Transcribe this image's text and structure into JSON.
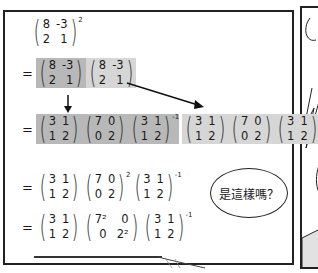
{
  "page": {
    "type": "manga-panel",
    "background": "#ffffff",
    "frame_color": "#222222"
  },
  "highlight_colors": {
    "dark": "#b8b8b8",
    "light": "#d6d6d6"
  },
  "line1": {
    "matrix": [
      [
        "8",
        "-3"
      ],
      [
        "2",
        "1"
      ]
    ],
    "exponent": "2"
  },
  "line2": {
    "equals": "=",
    "matrices": [
      {
        "values": [
          [
            "8",
            "-3"
          ],
          [
            "2",
            "1"
          ]
        ],
        "highlight": "dark"
      },
      {
        "values": [
          [
            "8",
            "-3"
          ],
          [
            "2",
            "1"
          ]
        ],
        "highlight": "light"
      }
    ]
  },
  "line3": {
    "equals": "=",
    "group1": {
      "highlight": "dark",
      "P": [
        [
          "3",
          "1"
        ],
        [
          "1",
          "2"
        ]
      ],
      "D": [
        [
          "7",
          "0"
        ],
        [
          "0",
          "2"
        ]
      ],
      "Pinv": [
        [
          "3",
          "1"
        ],
        [
          "1",
          "2"
        ]
      ],
      "inv_exp": "-1"
    },
    "group2": {
      "highlight": "light",
      "P": [
        [
          "3",
          "1"
        ],
        [
          "1",
          "2"
        ]
      ],
      "D": [
        [
          "7",
          "0"
        ],
        [
          "0",
          "2"
        ]
      ],
      "Pinv": [
        [
          "3",
          "1"
        ],
        [
          "1",
          "2"
        ]
      ],
      "inv_exp": "-1"
    }
  },
  "line4": {
    "equals": "=",
    "P": [
      [
        "3",
        "1"
      ],
      [
        "1",
        "2"
      ]
    ],
    "D": [
      [
        "7",
        "0"
      ],
      [
        "0",
        "2"
      ]
    ],
    "D_exp": "2",
    "Pinv": [
      [
        "3",
        "1"
      ],
      [
        "1",
        "2"
      ]
    ],
    "inv_exp": "-1"
  },
  "line5": {
    "equals": "=",
    "P": [
      [
        "3",
        "1"
      ],
      [
        "1",
        "2"
      ]
    ],
    "D": [
      [
        "7²",
        "0"
      ],
      [
        "0",
        "2²"
      ]
    ],
    "Pinv": [
      [
        "3",
        "1"
      ],
      [
        "1",
        "2"
      ]
    ],
    "inv_exp": "-1"
  },
  "speech_bubble": {
    "text": "是這樣嗎？"
  }
}
